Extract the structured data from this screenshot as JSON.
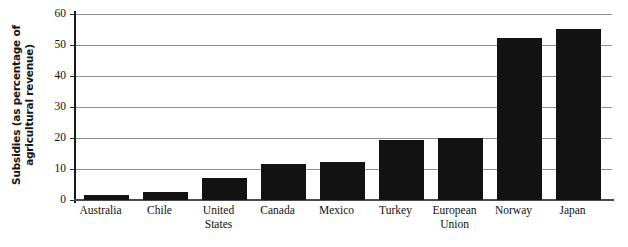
{
  "chart_data": {
    "type": "bar",
    "title": "",
    "subtitle": "",
    "xlabel": "",
    "ylabel": "Subsidies (as percentage of agricultural revenue)",
    "ylabel_lines": [
      "Subsidies (as percentage of",
      "agricultural revenue)"
    ],
    "categories": [
      "Australia",
      "Chile",
      "United States",
      "Canada",
      "Mexico",
      "Turkey",
      "European Union",
      "Norway",
      "Japan"
    ],
    "category_label_lines": [
      [
        "Australia"
      ],
      [
        "Chile"
      ],
      [
        "United",
        "States"
      ],
      [
        "Canada"
      ],
      [
        "Mexico"
      ],
      [
        "Turkey"
      ],
      [
        "European",
        "Union"
      ],
      [
        "Norway"
      ],
      [
        "Japan"
      ]
    ],
    "values": [
      1.7,
      2.5,
      7.2,
      11.5,
      12.2,
      19.2,
      20.0,
      52.3,
      55.2
    ],
    "ylim": [
      0,
      60
    ],
    "ytick_values": [
      0,
      10,
      20,
      30,
      40,
      50,
      60
    ],
    "ytick_labels": [
      "0",
      "10",
      "20",
      "30",
      "40",
      "50",
      "60"
    ],
    "grid": true,
    "grid_axis": "y",
    "legend": false,
    "legend_position": "none",
    "bar_color": "#121212",
    "grid_color": "#8f8f8f",
    "axis_color": "#1a1a1a",
    "background_color": "#ffffff"
  }
}
